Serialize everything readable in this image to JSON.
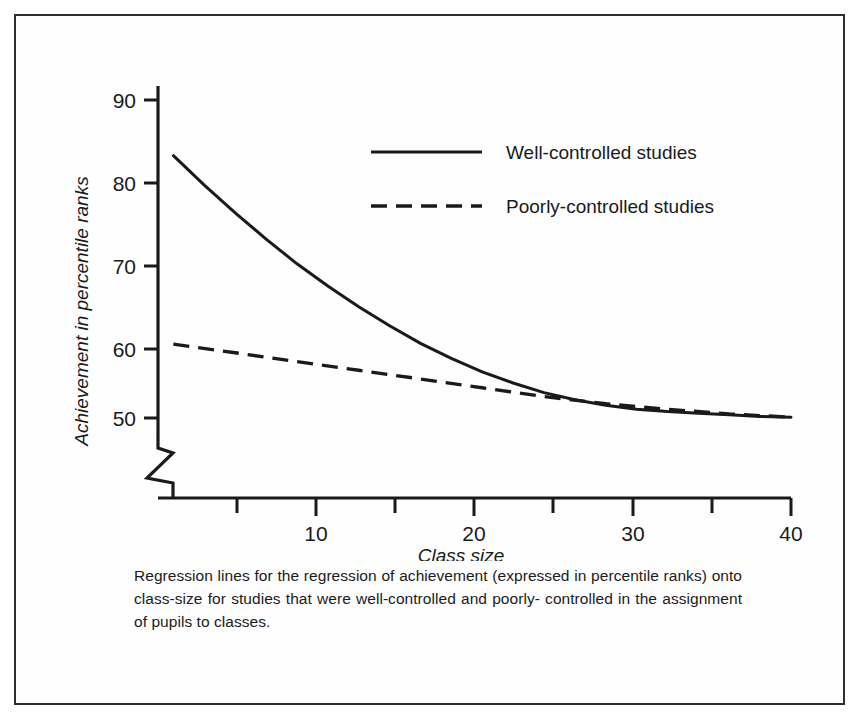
{
  "chart_data": {
    "type": "line",
    "title": "",
    "xlabel": "Class size",
    "ylabel": "Achievement in percentile ranks",
    "xlim": [
      0,
      41
    ],
    "ylim": [
      48,
      92
    ],
    "grid": false,
    "legend_position": "upper-right-inside",
    "y_axis_break": true,
    "x_ticks": [
      5,
      10,
      15,
      20,
      25,
      30,
      35,
      40
    ],
    "x_tick_labels": [
      "",
      "10",
      "",
      "20",
      "",
      "30",
      "",
      "40"
    ],
    "y_ticks": [
      50,
      60,
      70,
      80,
      90
    ],
    "y_tick_labels": [
      "50",
      "60",
      "70",
      "80",
      "90"
    ],
    "series": [
      {
        "name": "Well-controlled studies",
        "style": "solid",
        "x": [
          1,
          3,
          5,
          7,
          9,
          11,
          13,
          15,
          17,
          19,
          21,
          23,
          25,
          27,
          29,
          31,
          33,
          35,
          37,
          39,
          41
        ],
        "values": [
          83.0,
          79.3,
          75.8,
          72.5,
          69.4,
          66.6,
          64.0,
          61.6,
          59.4,
          57.5,
          55.8,
          54.4,
          53.2,
          52.3,
          51.6,
          51.1,
          50.8,
          50.6,
          50.4,
          50.2,
          50.1
        ]
      },
      {
        "name": "Poorly-controlled studies",
        "style": "dashed",
        "x": [
          1,
          5,
          9,
          13,
          17,
          21,
          25,
          29,
          33,
          37,
          41
        ],
        "values": [
          59.3,
          58.2,
          57.1,
          56.0,
          54.9,
          53.8,
          52.7,
          51.8,
          51.1,
          50.5,
          50.1
        ]
      }
    ]
  },
  "legend": {
    "items": [
      {
        "label": "Well-controlled studies",
        "style": "solid"
      },
      {
        "label": "Poorly-controlled studies",
        "style": "dashed"
      }
    ]
  },
  "axes": {
    "y_label": "Achievement in percentile ranks",
    "x_label": "Class size",
    "y_tick_90": "90",
    "y_tick_80": "80",
    "y_tick_70": "70",
    "y_tick_60": "60",
    "y_tick_50": "50",
    "x_tick_10": "10",
    "x_tick_20": "20",
    "x_tick_30": "30",
    "x_tick_40": "40"
  },
  "caption": {
    "line1": "Regression lines for the regression of achievement (expressed in percentile",
    "line2": "ranks) onto class-size for studies that were well-controlled and poorly-",
    "line3": "controlled in the assignment of pupils to classes.",
    "full": "Regression lines for the regression of achievement (expressed in percentile ranks) onto class-size for studies that were well-controlled and poorly-controlled in the assignment of pupils to classes."
  },
  "colors": {
    "ink": "#1a1a1a",
    "frame": "#2e2e2e",
    "paper": "#fefefe"
  }
}
